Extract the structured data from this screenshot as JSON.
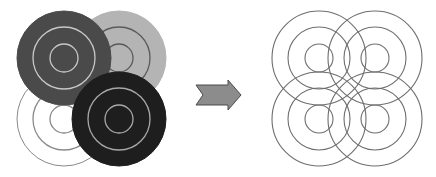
{
  "diagram": {
    "left_group": {
      "targets": [
        {
          "name": "top-left",
          "cx": 64,
          "cy": 58,
          "fill": "#4a4a4a",
          "ring": "#c8c8c8",
          "z": 3
        },
        {
          "name": "top-right",
          "cx": 119,
          "cy": 58,
          "fill": "#b4b4b4",
          "ring": "#5a5a5a",
          "z": 1
        },
        {
          "name": "bottom-left",
          "cx": 64,
          "cy": 119,
          "fill": "#ffffff",
          "ring": "#8a8a8a",
          "z": 0
        },
        {
          "name": "bottom-right",
          "cx": 119,
          "cy": 119,
          "fill": "#1e1e1e",
          "ring": "#a8a8a8",
          "z": 4
        }
      ],
      "radii": [
        47,
        31,
        14
      ]
    },
    "arrow": {
      "fill": "#8c8c8c",
      "stroke": "#4a4a4a",
      "direction": "right"
    },
    "right_group": {
      "targets": [
        {
          "name": "top-left",
          "cx": 319,
          "cy": 58
        },
        {
          "name": "top-right",
          "cx": 375,
          "cy": 58
        },
        {
          "name": "bottom-left",
          "cx": 319,
          "cy": 119
        },
        {
          "name": "bottom-right",
          "cx": 375,
          "cy": 119
        }
      ],
      "radii": [
        47,
        31,
        14
      ],
      "stroke": "#6e6e6e"
    }
  }
}
